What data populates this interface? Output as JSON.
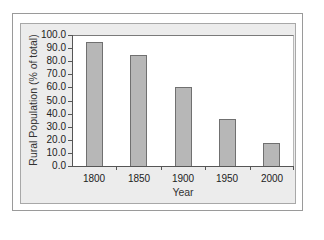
{
  "chart_data": {
    "type": "bar",
    "title": "",
    "xlabel": "Year",
    "ylabel": "Rural Population (% of total)",
    "categories": [
      "1800",
      "1850",
      "1900",
      "1950",
      "2000"
    ],
    "values": [
      94.5,
      84.7,
      60.3,
      35.9,
      17.6
    ],
    "ylim": [
      0,
      100
    ],
    "yticks": [
      "0.0",
      "10.0",
      "20.0",
      "30.0",
      "40.0",
      "50.0",
      "60.0",
      "70.0",
      "80.0",
      "90.0",
      "100.0"
    ],
    "grid": false,
    "legend": null,
    "bar_color": "#b7b7b7",
    "bar_edge_color": "#707070",
    "panel_color": "#ececec"
  }
}
